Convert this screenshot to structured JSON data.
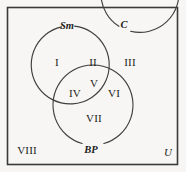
{
  "figure": {
    "kind": "venn-diagram-three-sets",
    "background_color": "#f7f6f4",
    "stroke_color": "#3a3a3a",
    "text_color": "#1d1d1d"
  },
  "universe": {
    "label": "U",
    "border_label": "rectangle"
  },
  "sets": [
    {
      "id": "sm",
      "label": "Sm",
      "cx": 71,
      "cy": 65,
      "r": 39,
      "label_x": 67,
      "label_y": 26
    },
    {
      "id": "c",
      "label": "C",
      "cx": 114,
      "cy": 65,
      "r": 39,
      "label_x": 124,
      "label_y": 25
    },
    {
      "id": "bp",
      "label": "BP",
      "cx": 93,
      "cy": 105,
      "r": 40,
      "label_x": 91,
      "label_y": 150
    }
  ],
  "regions": [
    {
      "id": "r1",
      "label": "I",
      "x": 57,
      "y": 62,
      "meaning": "Sm only"
    },
    {
      "id": "r2",
      "label": "II",
      "x": 93,
      "y": 62,
      "meaning": "Sm and C"
    },
    {
      "id": "r3",
      "label": "III",
      "x": 130,
      "y": 62,
      "meaning": "C only"
    },
    {
      "id": "r4",
      "label": "IV",
      "x": 75,
      "y": 93,
      "meaning": "Sm and BP"
    },
    {
      "id": "r5",
      "label": "V",
      "x": 94,
      "y": 83,
      "meaning": "Sm and C and BP"
    },
    {
      "id": "r6",
      "label": "VI",
      "x": 114,
      "y": 93,
      "meaning": "C and BP"
    },
    {
      "id": "r7",
      "label": "VII",
      "x": 94,
      "y": 118,
      "meaning": "BP only"
    },
    {
      "id": "r8",
      "label": "VIII",
      "x": 27,
      "y": 150,
      "meaning": "outside all sets"
    }
  ],
  "universe_label_pos": {
    "x": 168,
    "y": 152
  }
}
